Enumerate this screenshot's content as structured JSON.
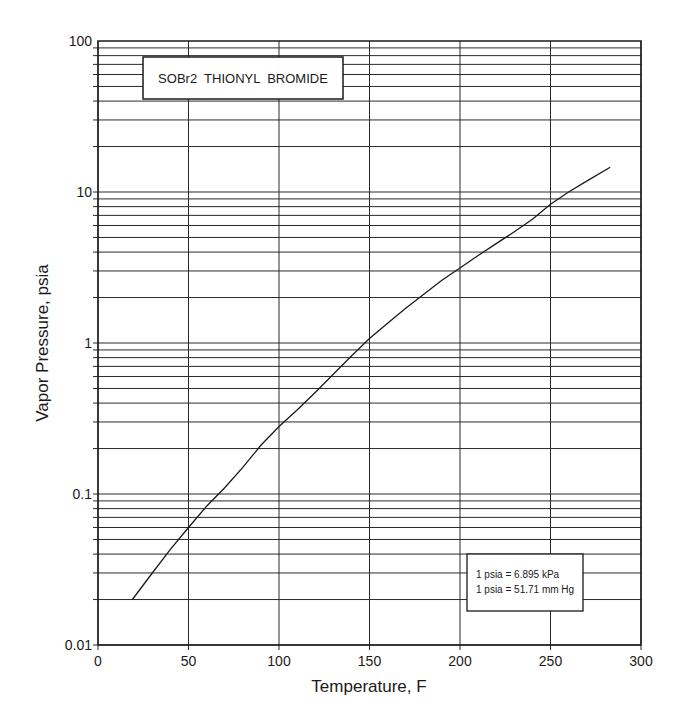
{
  "chart_data": {
    "type": "line",
    "title": "SOBr2  THIONYL  BROMIDE",
    "xlabel": "Temperature, F",
    "ylabel": "Vapor Pressure, psia",
    "xlim": [
      0,
      300
    ],
    "ylim": [
      0.01,
      100
    ],
    "yscale": "log",
    "grid": true,
    "x_ticks": [
      0,
      50,
      100,
      150,
      200,
      250,
      300
    ],
    "y_ticks": [
      0.01,
      0.1,
      1,
      10,
      100
    ],
    "y_tick_labels": [
      "0.01",
      "0.1",
      "1",
      "10",
      "100"
    ],
    "series": [
      {
        "name": "SOBr2 vapor pressure",
        "x": [
          19,
          30,
          40,
          50,
          60,
          70,
          80,
          90,
          100,
          110,
          120,
          130,
          140,
          150,
          160,
          170,
          180,
          190,
          200,
          210,
          220,
          230,
          240,
          250,
          260,
          270,
          283
        ],
        "y": [
          0.02,
          0.03,
          0.043,
          0.06,
          0.083,
          0.11,
          0.15,
          0.21,
          0.28,
          0.36,
          0.47,
          0.62,
          0.82,
          1.07,
          1.35,
          1.7,
          2.1,
          2.6,
          3.14,
          3.8,
          4.55,
          5.45,
          6.6,
          8.3,
          10.0,
          11.8,
          14.6
        ]
      }
    ],
    "annotations": [
      "1 psia = 6.895 kPa",
      "1 psia = 51.71 mm Hg"
    ]
  },
  "labels": {
    "title": "SOBr2  THIONYL  BROMIDE",
    "xlabel": "Temperature, F",
    "ylabel": "Vapor Pressure, psia",
    "conversion_line1": "1 psia = 6.895 kPa",
    "conversion_line2": "1 psia = 51.71 mm Hg"
  },
  "style": {
    "line_color": "#1a1a1a",
    "grid_color": "#2a2a2a",
    "background": "#ffffff"
  }
}
